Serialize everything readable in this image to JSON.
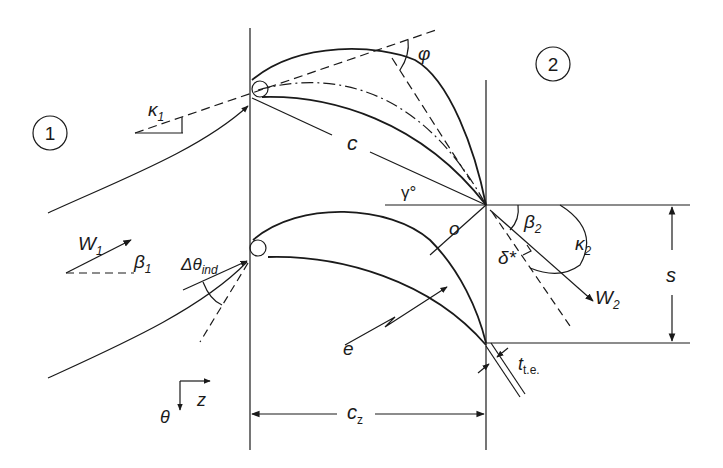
{
  "diagram": {
    "stations": [
      {
        "id": "station-1",
        "label": "1"
      },
      {
        "id": "station-2",
        "label": "2"
      }
    ],
    "labels": {
      "kappa1": {
        "main": "κ",
        "sub": "1"
      },
      "phi": {
        "main": "φ"
      },
      "chord": {
        "main": "c"
      },
      "stagger": {
        "main": "γ°"
      },
      "w1": {
        "main": "W",
        "sub": "1"
      },
      "beta1": {
        "main": "β",
        "sub": "1"
      },
      "delta_theta_ind": {
        "main": "Δθ",
        "sub": "ind"
      },
      "throat": {
        "main": "o"
      },
      "beta2": {
        "main": "β",
        "sub": "2"
      },
      "kappa2": {
        "main": "κ",
        "sub": "2"
      },
      "deviation": {
        "main": "δ*"
      },
      "w2": {
        "main": "W",
        "sub": "2"
      },
      "pitch": {
        "main": "s"
      },
      "e": {
        "main": "e"
      },
      "trailing_edge_thickness": {
        "main": "t",
        "sub": "t.e."
      },
      "axial_chord": {
        "main": "c",
        "sub": "z"
      },
      "axis_z": {
        "main": "z"
      },
      "axis_theta": {
        "main": "θ"
      }
    },
    "colors": {
      "line": "#1a1a1a",
      "background": "#ffffff"
    }
  }
}
